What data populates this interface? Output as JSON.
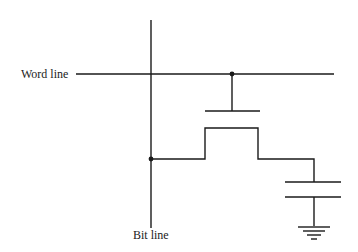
{
  "diagram": {
    "labels": {
      "word_line": "Word line",
      "bit_line": "Bit line"
    },
    "components": [
      "word-line",
      "bit-line",
      "access-transistor",
      "storage-capacitor",
      "ground"
    ],
    "colors": {
      "stroke": "#1a1a1a",
      "background": "#ffffff"
    }
  }
}
